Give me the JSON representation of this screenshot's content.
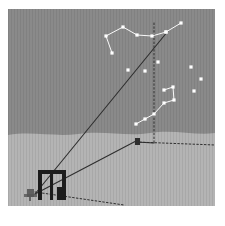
{
  "figure": {
    "domain": "astronomy-illustration",
    "canvas": {
      "width": 225,
      "height": 226,
      "border_color": "#ffffff"
    },
    "palette": {
      "sky": "#8a8a8a",
      "ground": "#b4b4b4",
      "star": "#ffffff",
      "line_dark": "#2e2e2e",
      "structure": "#1c1c1c",
      "figure": "#555555"
    }
  },
  "scene": {
    "sky": {
      "label": "night sky",
      "color": "#8a8a8a",
      "top": 0,
      "height": 124
    },
    "ground": {
      "label": "ground plane",
      "color": "#b4b4b4"
    },
    "horizon": {
      "label": "horizon line",
      "path": "M0,126 C24,122 46,128 70,125 C96,121 118,128 142,124 C166,120 188,127 207,124 L207,197 L0,197 Z"
    }
  },
  "constellations": [
    {
      "name": "big-dipper",
      "label": "Big Dipper",
      "stars": [
        {
          "id": "bd1",
          "x": 104,
          "y": 44
        },
        {
          "id": "bd2",
          "x": 98,
          "y": 27
        },
        {
          "id": "bd3",
          "x": 115,
          "y": 18
        },
        {
          "id": "bd4",
          "x": 129,
          "y": 26
        },
        {
          "id": "bd5",
          "x": 144,
          "y": 27
        },
        {
          "id": "bd6",
          "x": 158,
          "y": 23
        },
        {
          "id": "bd7",
          "x": 173,
          "y": 14
        }
      ],
      "segments": [
        [
          0,
          1
        ],
        [
          1,
          2
        ],
        [
          2,
          3
        ],
        [
          3,
          4
        ],
        [
          4,
          5
        ],
        [
          5,
          6
        ]
      ]
    },
    {
      "name": "little-dipper",
      "label": "Little Dipper",
      "stars": [
        {
          "id": "ld1",
          "x": 158,
          "y": 23
        },
        {
          "id": "ld2",
          "x": 156,
          "y": 81
        },
        {
          "id": "ld3",
          "x": 165,
          "y": 78
        },
        {
          "id": "ld4",
          "x": 166,
          "y": 91
        },
        {
          "id": "ld5",
          "x": 156,
          "y": 94
        },
        {
          "id": "ld6",
          "x": 146,
          "y": 105
        },
        {
          "id": "ld7",
          "x": 137,
          "y": 110
        },
        {
          "id": "ld8",
          "x": 128,
          "y": 115
        }
      ],
      "segments": [
        [
          1,
          2
        ],
        [
          2,
          3
        ],
        [
          3,
          4
        ],
        [
          4,
          5
        ],
        [
          5,
          6
        ],
        [
          6,
          7
        ]
      ]
    }
  ],
  "loose_stars": [
    {
      "id": "s1",
      "x": 120,
      "y": 61
    },
    {
      "id": "s2",
      "x": 137,
      "y": 62
    },
    {
      "id": "s3",
      "x": 150,
      "y": 53
    },
    {
      "id": "s4",
      "x": 183,
      "y": 58
    },
    {
      "id": "s5",
      "x": 193,
      "y": 70
    },
    {
      "id": "s6",
      "x": 186,
      "y": 82
    }
  ],
  "sight_lines": [
    {
      "name": "observer-to-polaris",
      "label": "sight line from observer to pole star",
      "style": "solid",
      "x1": 27,
      "y1": 185,
      "x2": 160,
      "y2": 22
    },
    {
      "name": "observer-to-horizon-marker",
      "label": "sight line from observer to horizon marker",
      "style": "solid",
      "x1": 27,
      "y1": 185,
      "x2": 128,
      "y2": 132
    },
    {
      "name": "observer-baseline",
      "label": "ground baseline from observer",
      "style": "dotted",
      "x1": 27,
      "y1": 183,
      "x2": 116,
      "y2": 196
    },
    {
      "name": "meridian-vertical",
      "label": "vertical meridian drop line",
      "style": "dotted",
      "x1": 146,
      "y1": 14,
      "x2": 146,
      "y2": 134
    },
    {
      "name": "ground-axis-right",
      "label": "ground axis to the right",
      "style": "dotted",
      "x1": 128,
      "y1": 133,
      "x2": 207,
      "y2": 136
    },
    {
      "name": "meridian-foot-to-marker",
      "label": "ground link from meridian foot to marker",
      "style": "solid",
      "x1": 146,
      "y1": 134,
      "x2": 128,
      "y2": 133
    }
  ],
  "ground_marker": {
    "name": "horizon-marker",
    "label": "dark survey marker on horizon",
    "x": 127,
    "y": 129,
    "width": 5,
    "height": 7
  },
  "structures": [
    {
      "name": "doorway-frame",
      "label": "doorway / gate frame",
      "x": 30,
      "y": 161,
      "width": 28,
      "height": 30,
      "post_width": 4,
      "lintel_height": 4
    },
    {
      "name": "door-post-center",
      "label": "center door post",
      "x": 42,
      "y": 165,
      "width": 3,
      "height": 26
    },
    {
      "name": "door-block",
      "label": "dark block at door base",
      "x": 49,
      "y": 178,
      "width": 6,
      "height": 13
    },
    {
      "name": "observer-figure",
      "label": "observer figure at left",
      "x": 16,
      "y": 180,
      "width": 13,
      "height": 12
    }
  ]
}
